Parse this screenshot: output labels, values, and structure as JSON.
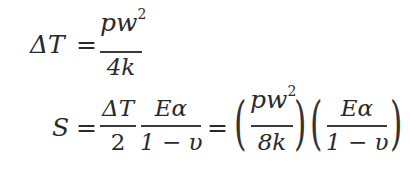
{
  "equations": [
    {
      "id": "eq1",
      "lhs": "ΔT",
      "equals": "=",
      "rhs": {
        "numerator_base": "pw",
        "numerator_exp": "2",
        "denominator": "4k"
      }
    },
    {
      "id": "eq2",
      "lhs": "S",
      "equals": "=",
      "frac1": {
        "numerator": "ΔT",
        "denominator": "2"
      },
      "frac2": {
        "numerator": "Eα",
        "denominator": "1 − υ"
      },
      "equals2": "=",
      "group1": {
        "numerator_base": "pw",
        "numerator_exp": "2",
        "denominator": "8k"
      },
      "group2": {
        "numerator": "Eα",
        "denominator": "1 − υ"
      },
      "open_paren": "(",
      "close_paren": ")"
    }
  ]
}
